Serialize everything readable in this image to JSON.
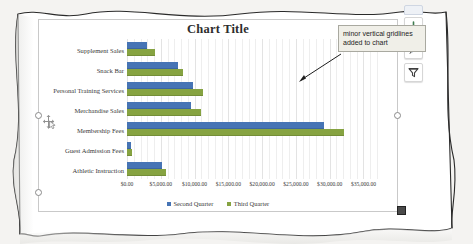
{
  "document": {
    "kind": "scanned-page-excel-chart"
  },
  "chart": {
    "title": "Chart Title",
    "selected": true,
    "side_buttons": [
      {
        "name": "chart-elements-button",
        "label": "+",
        "icon": "plus-icon"
      },
      {
        "name": "chart-styles-button",
        "label": "",
        "icon": "paintbrush-icon"
      },
      {
        "name": "chart-filters-button",
        "label": "",
        "icon": "funnel-icon"
      }
    ],
    "colors": {
      "second_quarter": "#4674b5",
      "third_quarter": "#86a341",
      "minor_gridline": "#eeeeee",
      "major_gridline": "#e3e3e3",
      "callout_background": "#f0efe8",
      "callout_border": "#a9a9a0"
    }
  },
  "callout": {
    "text": "minor vertical gridlines added to chart"
  },
  "chart_data": {
    "type": "bar",
    "orientation": "horizontal",
    "title": "Chart Title",
    "xlabel": "",
    "ylabel": "",
    "xlim": [
      0,
      37000
    ],
    "grid": true,
    "minor_gridlines": true,
    "legend_position": "bottom",
    "tick_labels": [
      "$0.00",
      "$5,000.00",
      "$10,000.00",
      "$15,000.00",
      "$20,000.00",
      "$25,000.00",
      "$30,000.00",
      "$35,000.00"
    ],
    "tick_values": [
      0,
      5000,
      10000,
      15000,
      20000,
      25000,
      30000,
      35000
    ],
    "categories": [
      "Supplement Sales",
      "Snack Bar",
      "Personal Training Services",
      "Merchandise Sales",
      "Membership Fees",
      "Guest Admission Fees",
      "Athletic Instruction"
    ],
    "series": [
      {
        "name": "Second Quarter",
        "color": "#4674b5",
        "values": [
          3000,
          7500,
          9800,
          9500,
          29200,
          600,
          5200
        ]
      },
      {
        "name": "Third Quarter",
        "color": "#86a341",
        "values": [
          4100,
          8300,
          11200,
          11000,
          32100,
          700,
          5800
        ]
      }
    ]
  }
}
